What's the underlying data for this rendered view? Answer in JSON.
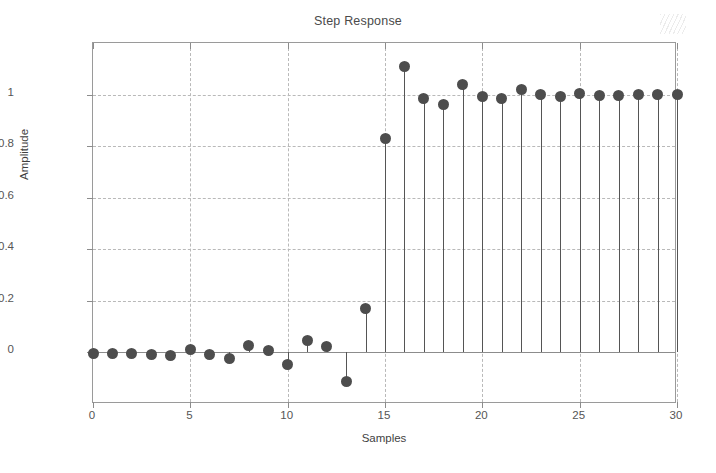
{
  "chart_data": {
    "type": "scatter",
    "title": "Step Response",
    "xlabel": "Samples",
    "ylabel": "Amplitude",
    "style": "stem",
    "grid": true,
    "legend": null,
    "xlim": [
      0,
      30
    ],
    "ylim": [
      -0.2,
      1.2
    ],
    "xticks": [
      0,
      5,
      10,
      15,
      20,
      25,
      30
    ],
    "xtick_labels": [
      "0",
      "5",
      "10",
      "15",
      "20",
      "25",
      "30"
    ],
    "yticks": [
      0,
      0.2,
      0.4,
      0.6,
      0.8,
      1
    ],
    "ytick_labels": [
      "0",
      "0.2",
      "0.4",
      "0.6",
      "0.8",
      "1"
    ],
    "marker_color": "#4d4d4d",
    "stem_color": "#555555",
    "axis_color": "#8c8c8c",
    "grid_color": "#b9b9b9",
    "background": "#ffffff",
    "x": [
      0,
      1,
      2,
      3,
      4,
      5,
      6,
      7,
      8,
      9,
      10,
      11,
      12,
      13,
      14,
      15,
      16,
      17,
      18,
      19,
      20,
      21,
      22,
      23,
      24,
      25,
      26,
      27,
      28,
      29,
      30
    ],
    "values": [
      -0.005,
      -0.005,
      -0.005,
      -0.008,
      -0.012,
      0.012,
      -0.008,
      -0.022,
      0.028,
      0.008,
      -0.045,
      0.045,
      0.022,
      -0.112,
      0.17,
      0.83,
      1.11,
      0.983,
      0.962,
      1.04,
      0.993,
      0.985,
      1.018,
      1.0,
      0.993,
      1.005,
      0.998,
      0.998,
      1.0,
      1.0,
      1.0
    ]
  },
  "figure": {
    "title": "Step Response",
    "x_axis_title": "Samples",
    "y_axis_title": "Amplitude"
  }
}
